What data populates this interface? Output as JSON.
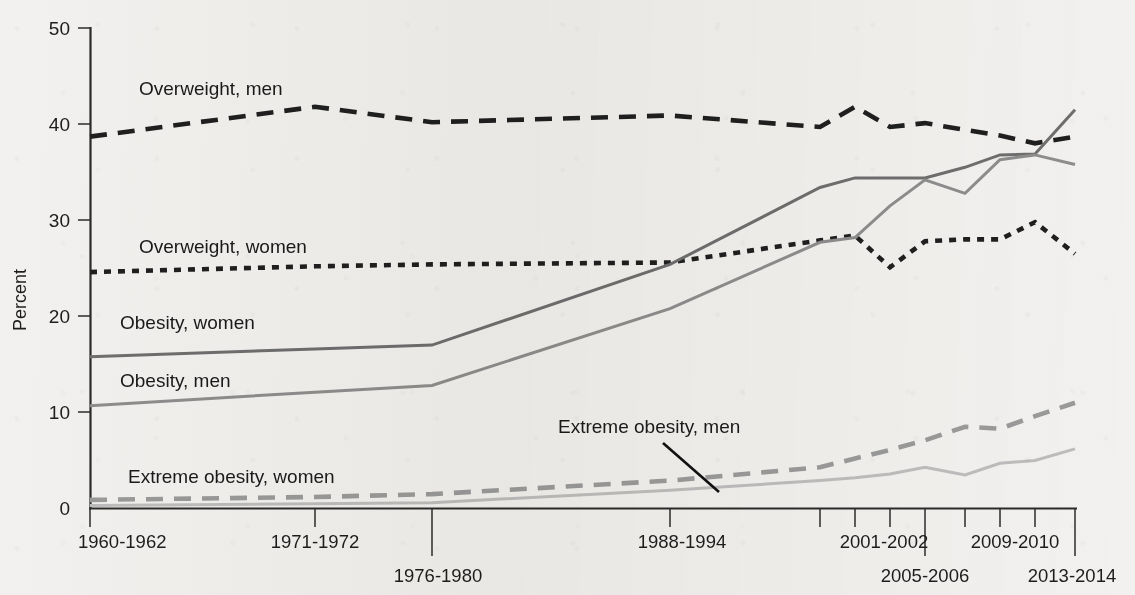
{
  "chart_data": {
    "type": "line",
    "title": "",
    "xlabel": "",
    "ylabel": "Percent",
    "ylim": [
      0,
      50
    ],
    "yticks": [
      0,
      10,
      20,
      30,
      40,
      50
    ],
    "grid": false,
    "legend": "inline-labels",
    "categories": [
      "1960-1962",
      "1971-1974",
      "1976-1980",
      "1988-1994",
      "1999-2000",
      "2001-2002",
      "2003-2004",
      "2005-2006",
      "2007-2008",
      "2009-2010",
      "2011-2012",
      "2013-2014"
    ],
    "tick_labels_shown": [
      "1960-1962",
      "1971-1972",
      "1976-1980",
      "1988-1994",
      "2001-2002",
      "2005-2006",
      "2009-2010",
      "2013-2014"
    ],
    "series": [
      {
        "name": "Overweight, men",
        "style": "dashed",
        "color": "#1f1f1f",
        "values": [
          38.7,
          41.8,
          40.2,
          40.9,
          39.7,
          41.8,
          39.7,
          40.1,
          39.4,
          38.8,
          38.0,
          38.7
        ]
      },
      {
        "name": "Overweight, women",
        "style": "dotted",
        "color": "#1f1f1f",
        "values": [
          24.6,
          25.2,
          25.4,
          25.6,
          27.9,
          28.4,
          25.1,
          27.8,
          28.0,
          28.0,
          29.8,
          26.5
        ]
      },
      {
        "name": "Obesity, women",
        "style": "solid",
        "color": "#6e6e6e",
        "values": [
          15.8,
          16.6,
          17.0,
          25.4,
          33.4,
          34.4,
          34.4,
          34.4,
          35.5,
          36.8,
          36.9,
          41.5
        ]
      },
      {
        "name": "Obesity, men",
        "style": "solid",
        "color": "#8d8d8d",
        "values": [
          10.7,
          12.1,
          12.8,
          20.8,
          27.7,
          28.2,
          31.5,
          34.2,
          32.8,
          36.3,
          36.8,
          35.8
        ]
      },
      {
        "name": "Extreme obesity, men",
        "style": "dashed",
        "color": "#9a9a9a",
        "values": [
          0.9,
          1.2,
          1.5,
          2.9,
          4.3,
          5.2,
          6.1,
          7.1,
          8.5,
          8.3,
          9.6,
          11.0
        ]
      },
      {
        "name": "Extreme obesity, women",
        "style": "solid",
        "color": "#bdbdbd",
        "values": [
          0.3,
          0.5,
          0.6,
          1.9,
          2.9,
          3.2,
          3.6,
          4.3,
          3.5,
          4.7,
          5.0,
          6.2
        ]
      }
    ],
    "annotations": [
      {
        "text": "Overweight, men",
        "at": "upper-left plot area"
      },
      {
        "text": "Overweight, women",
        "at": "mid-left plot area"
      },
      {
        "text": "Obesity, women",
        "at": "mid-left plot area"
      },
      {
        "text": "Obesity, men",
        "at": "lower-mid-left plot area"
      },
      {
        "text": "Extreme obesity, men",
        "at": "lower-center with leader line"
      },
      {
        "text": "Extreme obesity, women",
        "at": "lower-left plot area"
      }
    ]
  },
  "axis": {
    "y_title": "Percent",
    "y_ticks": [
      "0",
      "10",
      "20",
      "30",
      "40",
      "50"
    ],
    "x_ticks_row1": [
      "1960-1962",
      "1971-1972",
      "1988-1994",
      "2001-2002",
      "2009-2010"
    ],
    "x_ticks_row2": [
      "1976-1980",
      "2005-2006",
      "2013-2014"
    ]
  },
  "labels": {
    "overweight_men": "Overweight, men",
    "overweight_women": "Overweight, women",
    "obesity_women": "Obesity, women",
    "obesity_men": "Obesity, men",
    "extreme_men": "Extreme obesity, men",
    "extreme_women": "Extreme obesity, women"
  },
  "colors": {
    "ink": "#1f1f1f",
    "obesity_women": "#6e6e6e",
    "obesity_men": "#8d8d8d",
    "extreme_men": "#9a9a9a",
    "extreme_women": "#bdbdbd",
    "paper": "#f2f1ef"
  }
}
